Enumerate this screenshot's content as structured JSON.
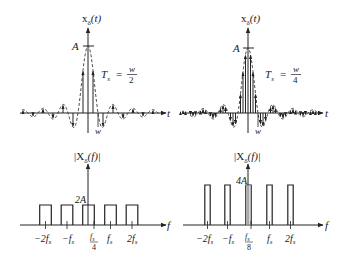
{
  "panels": {
    "top_left": {
      "title": "x",
      "title_sub": "δ",
      "title_arg": "(t)",
      "amplitude_label": "A",
      "ts_label": "T",
      "ts_sub": "s",
      "ts_eq": "=",
      "ts_num": "w",
      "ts_den": "2",
      "axis_label": "t",
      "w_label": "w"
    },
    "top_right": {
      "title": "x",
      "title_sub": "δ",
      "title_arg": "(t)",
      "amplitude_label": "A",
      "ts_label": "T",
      "ts_sub": "s",
      "ts_eq": "=",
      "ts_num": "w",
      "ts_den": "4",
      "axis_label": "t",
      "w_label": "w"
    },
    "bottom_left": {
      "title_pre": "|X",
      "title_sub": "δ",
      "title_post": "(f)|",
      "amplitude_label": "2A",
      "axis_label": "f",
      "ticks": [
        "−2f",
        "−f",
        "f",
        "f",
        "2f"
      ],
      "tick_subs": [
        "s",
        "s",
        "s",
        "s",
        "s"
      ],
      "center_frac_den": "4"
    },
    "bottom_right": {
      "title_pre": "|X",
      "title_sub": "δ",
      "title_post": "(f)|",
      "amplitude_label": "4A",
      "axis_label": "f",
      "ticks": [
        "−2f",
        "−f",
        "f",
        "f",
        "2f"
      ],
      "tick_subs": [
        "s",
        "s",
        "s",
        "s",
        "s"
      ],
      "center_frac_den": "8"
    }
  },
  "chart_data": [
    {
      "type": "line",
      "title": "x_δ(t)",
      "xlabel": "t",
      "description": "Sampled sinc pulse with dashed sinc envelope, T_s = w/2",
      "sampling_interval": "w/2",
      "peak": "A"
    },
    {
      "type": "line",
      "title": "x_δ(t)",
      "xlabel": "t",
      "description": "Sampled sinc pulse with dashed sinc envelope, T_s = w/4",
      "sampling_interval": "w/4",
      "peak": "A"
    },
    {
      "type": "bar",
      "title": "|X_δ(f)|",
      "xlabel": "f",
      "categories": [
        "-2f_s",
        "-f_s",
        "0",
        "f_s",
        "2f_s"
      ],
      "values": [
        2,
        2,
        2,
        2,
        2
      ],
      "value_unit": "A",
      "half_bandwidth": "f_s/4"
    },
    {
      "type": "bar",
      "title": "|X_δ(f)|",
      "xlabel": "f",
      "categories": [
        "-2f_s",
        "-f_s",
        "0",
        "f_s",
        "2f_s"
      ],
      "values": [
        4,
        4,
        4,
        4,
        4
      ],
      "value_unit": "A",
      "half_bandwidth": "f_s/8"
    }
  ]
}
